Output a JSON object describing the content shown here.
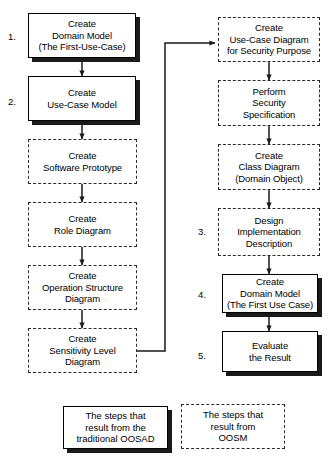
{
  "diagram": {
    "colors": {
      "stroke": "#000000",
      "shadow": "#1a1a1a",
      "dashed_stroke": "#2b2b2b",
      "background": "#ffffff"
    }
  },
  "left_column": [
    {
      "id": "create-domain-model",
      "number": "1.",
      "style": "solid",
      "text": "Create\nDomain Model\n(The First-Use-Case)"
    },
    {
      "id": "create-use-case-model",
      "number": "2.",
      "style": "solid",
      "text": "Create\nUse-Case Model"
    },
    {
      "id": "create-software-prototype",
      "number": "",
      "style": "dashed",
      "text": "Create\nSoftware Prototype"
    },
    {
      "id": "create-role-diagram",
      "number": "",
      "style": "dashed",
      "text": "Create\nRole Diagram"
    },
    {
      "id": "create-operation-structure-diagram",
      "number": "",
      "style": "dashed",
      "text": "Create\nOperation Structure\nDiagram"
    },
    {
      "id": "create-sensitivity-level-diagram",
      "number": "",
      "style": "dashed",
      "text": "Create\nSensitivity Level\nDiagram"
    }
  ],
  "right_column": [
    {
      "id": "create-use-case-diagram-security",
      "number": "",
      "style": "dashed",
      "text": "Create\nUse-Case Diagram\nfor Security Purpose"
    },
    {
      "id": "perform-security-specification",
      "number": "",
      "style": "dashed",
      "text": "Perform\nSecurity\nSpecification"
    },
    {
      "id": "create-class-diagram",
      "number": "",
      "style": "dashed",
      "text": "Create\nClass Diagram\n(Domain Object)"
    },
    {
      "id": "design-implementation-description",
      "number": "3.",
      "style": "dashed",
      "text": "Design\nImplementation\nDescription"
    },
    {
      "id": "create-domain-model-2",
      "number": "4.",
      "style": "solid",
      "text": "Create\nDomain Model\n(The First Use Case)"
    },
    {
      "id": "evaluate-the-result",
      "number": "5.",
      "style": "solid",
      "text": "Evaluate\nthe Result"
    }
  ],
  "legend": [
    {
      "id": "legend-oosad",
      "style": "solid",
      "text": "The steps that\nresult from the\ntraditional OOSAD"
    },
    {
      "id": "legend-oosm",
      "style": "dashed",
      "text": "The steps that\nresult from\nOOSM"
    }
  ]
}
